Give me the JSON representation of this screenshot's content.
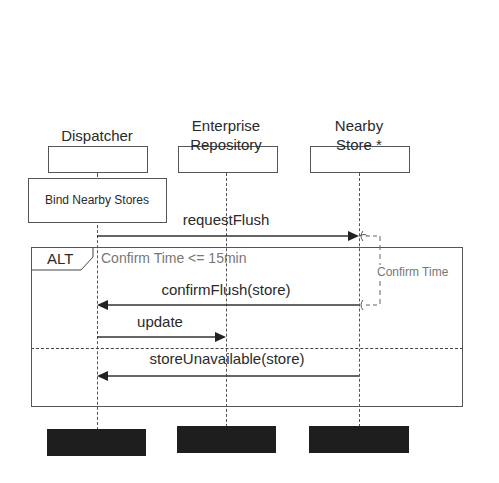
{
  "participants": [
    {
      "name": "Dispatcher",
      "x": 97
    },
    {
      "name": "Enterprise\nRepository",
      "line1": "Enterprise",
      "line2": "Repository",
      "x": 226
    },
    {
      "name": "Nearby\nStore *",
      "line1": "Nearby",
      "line2": "Store *",
      "x": 359
    }
  ],
  "activation_note": "Bind Nearby Stores",
  "messages": [
    {
      "label": "requestFlush",
      "from": "Dispatcher",
      "to": "Nearby Store *"
    },
    {
      "label": "confirmFlush(store)",
      "from": "Nearby Store *",
      "to": "Dispatcher"
    },
    {
      "label": "update",
      "from": "Dispatcher",
      "to": "Enterprise Repository"
    },
    {
      "label": "storeUnavailable(store)",
      "from": "Nearby Store *",
      "to": "Dispatcher"
    }
  ],
  "fragment": {
    "operator": "ALT",
    "guard": "Confirm Time <= 15min"
  },
  "timing_constraint": "Confirm Time",
  "colors": {
    "line": "#333333",
    "guard_text": "#777777",
    "redacted": "#1e1e1e"
  }
}
